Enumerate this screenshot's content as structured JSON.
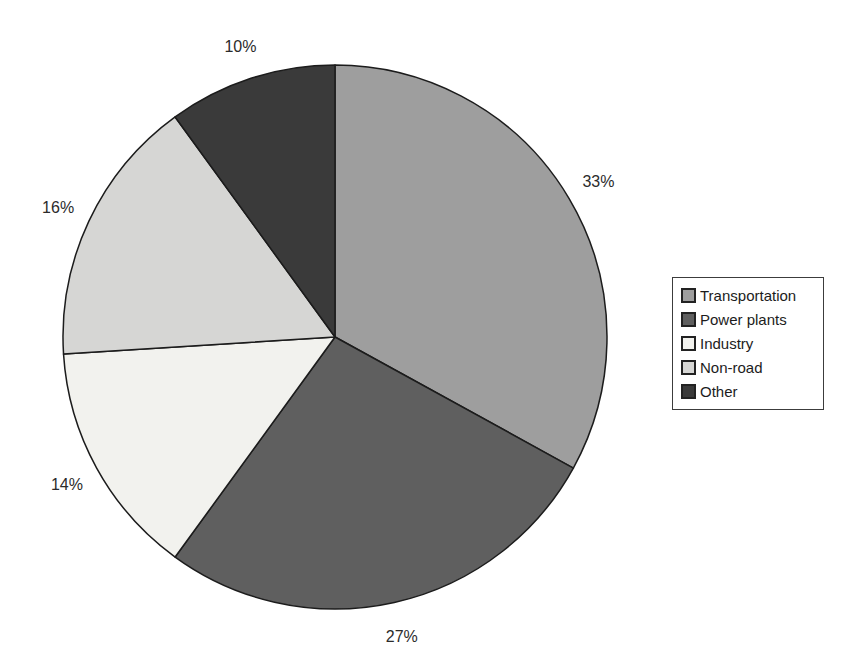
{
  "chart_data": {
    "type": "pie",
    "title": "",
    "categories": [
      "Transportation",
      "Power plants",
      "Industry",
      "Non-road",
      "Other"
    ],
    "values": [
      33,
      27,
      14,
      16,
      10
    ],
    "slices": [
      {
        "label": "Transportation",
        "value": 33,
        "data_label": "33%",
        "color": "#9e9e9e"
      },
      {
        "label": "Power plants",
        "value": 27,
        "data_label": "27%",
        "color": "#5f5f5f"
      },
      {
        "label": "Industry",
        "value": 14,
        "data_label": "14%",
        "color": "#f2f2ee"
      },
      {
        "label": "Non-road",
        "value": 16,
        "data_label": "16%",
        "color": "#d6d6d4"
      },
      {
        "label": "Other",
        "value": 10,
        "data_label": "10%",
        "color": "#3a3a3a"
      }
    ],
    "start_angle_deg": 0,
    "direction": "clockwise",
    "data_label_style": "percent-outside",
    "legend_position": "right",
    "legend_border": true,
    "outline_color": "#1c1c1c",
    "background_color": "#ffffff",
    "label_color": "#2b2b2b"
  }
}
